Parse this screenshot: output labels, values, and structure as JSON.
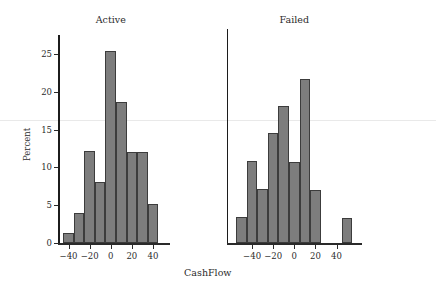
{
  "chart_data": {
    "type": "bar",
    "title": "",
    "xlabel": "CashFlow",
    "ylabel": "Percent",
    "ylim": [
      0,
      27.5
    ],
    "yticks": [
      0,
      5,
      10,
      15,
      20,
      25
    ],
    "xticks": [
      -40,
      -20,
      0,
      20,
      40
    ],
    "xticklabels": [
      "−40",
      "−20",
      "0",
      "20",
      "40"
    ],
    "bin_width": 10,
    "grid": false,
    "legend": "none",
    "bar_color": "#7d7d7d",
    "bar_edge_color": "#3c3c3c",
    "axis_color": "#2a2a2a",
    "reference_line_value": 16.2,
    "reference_line_color": "#e9e9e9",
    "panels": [
      {
        "name": "Active",
        "label": "Active",
        "xlim": [
          -50,
          50
        ],
        "bins": [
          {
            "start": -45,
            "end": -35,
            "center": -40,
            "value": 1.3
          },
          {
            "start": -35,
            "end": -25,
            "center": -30,
            "value": 4.0
          },
          {
            "start": -25,
            "end": -15,
            "center": -20,
            "value": 12.1
          },
          {
            "start": -15,
            "end": -5,
            "center": -10,
            "value": 8.0
          },
          {
            "start": -5,
            "end": 5,
            "center": 0,
            "value": 25.4
          },
          {
            "start": 5,
            "end": 15,
            "center": 10,
            "value": 18.7
          },
          {
            "start": 15,
            "end": 25,
            "center": 20,
            "value": 12.0
          },
          {
            "start": 25,
            "end": 35,
            "center": 30,
            "value": 12.0
          },
          {
            "start": 35,
            "end": 45,
            "center": 40,
            "value": 5.2
          }
        ]
      },
      {
        "name": "Failed",
        "label": "Failed",
        "xlim": [
          -60,
          60
        ],
        "bins": [
          {
            "start": -55,
            "end": -45,
            "center": -50,
            "value": 3.5
          },
          {
            "start": -45,
            "end": -35,
            "center": -40,
            "value": 10.8
          },
          {
            "start": -35,
            "end": -25,
            "center": -30,
            "value": 7.1
          },
          {
            "start": -25,
            "end": -15,
            "center": -20,
            "value": 14.6
          },
          {
            "start": -15,
            "end": -5,
            "center": -10,
            "value": 18.1
          },
          {
            "start": -5,
            "end": 5,
            "center": 0,
            "value": 10.7
          },
          {
            "start": 5,
            "end": 15,
            "center": 10,
            "value": 21.7
          },
          {
            "start": 15,
            "end": 25,
            "center": 20,
            "value": 7.0
          },
          {
            "start": 25,
            "end": 35,
            "center": 30,
            "value": 0
          },
          {
            "start": 35,
            "end": 45,
            "center": 40,
            "value": 0
          },
          {
            "start": 45,
            "end": 55,
            "center": 50,
            "value": 3.3
          }
        ]
      }
    ]
  }
}
